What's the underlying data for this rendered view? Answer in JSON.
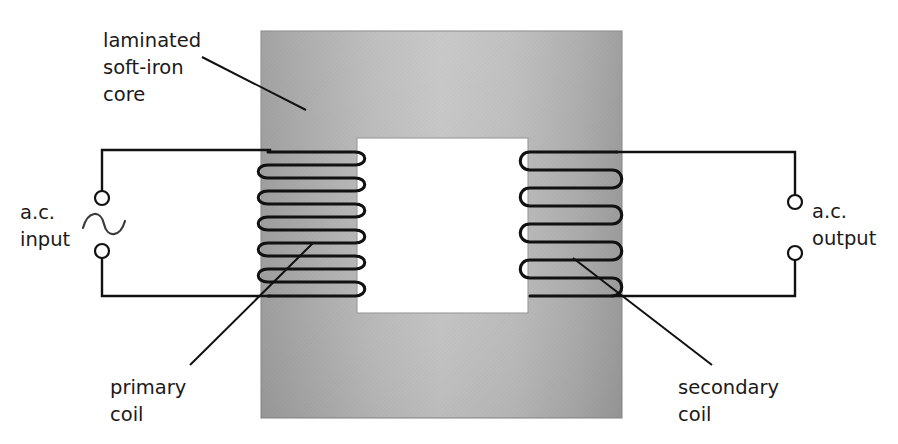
{
  "figure": {
    "background_color": "#ffffff"
  },
  "labels": {
    "core": {
      "line1": "laminated",
      "line2": "soft-iron",
      "line3": "core"
    },
    "ac_input": {
      "line1": "a.c.",
      "line2": "input"
    },
    "ac_output": {
      "line1": "a.c.",
      "line2": "output"
    },
    "primary": {
      "line1": "primary",
      "line2": "coil"
    },
    "secondary": {
      "line1": "secondary",
      "line2": "coil"
    }
  },
  "colors": {
    "core_fill_dark": "#a2a2a2",
    "core_fill_light": "#c9c9c9",
    "core_edge": "#8d8d8d",
    "wire": "#111111",
    "text": "#1a1a1a",
    "window_fill": "#ffffff"
  },
  "geometry": {
    "core": {
      "x": 261,
      "y": 31,
      "width": 361,
      "height": 387
    },
    "window": {
      "x": 357,
      "y": 138,
      "width": 171,
      "height": 175
    },
    "primary_coil": {
      "x_left": 268,
      "x_right": 362,
      "y_top": 152,
      "y_bottom": 296,
      "turns": 11
    },
    "secondary_coil": {
      "x_left": 523,
      "x_right": 617,
      "y_top": 152,
      "y_bottom": 296,
      "turns": 8
    },
    "input_terminals": [
      {
        "cx": 102,
        "cy": 198,
        "r": 7
      },
      {
        "cx": 102,
        "cy": 251,
        "r": 7
      }
    ],
    "output_terminals": [
      {
        "cx": 795,
        "cy": 202,
        "r": 7
      },
      {
        "cx": 795,
        "cy": 253,
        "r": 7
      }
    ]
  },
  "turn_counts": {
    "primary_coil_turns": 11,
    "secondary_coil_turns": 8
  }
}
